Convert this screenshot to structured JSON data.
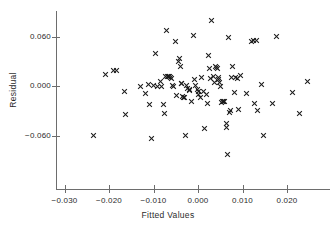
{
  "chart_data": {
    "type": "scatter",
    "title": "",
    "xlabel": "Fitted Values",
    "ylabel": "Residual",
    "xlim": [
      -0.0325,
      0.0295
    ],
    "ylim": [
      -0.093,
      0.093
    ],
    "grid": false,
    "legend": null,
    "marker": "x",
    "marker_color": "#1c1c1c",
    "xticks": [
      -0.03,
      -0.02,
      -0.01,
      0.0,
      0.01,
      0.02
    ],
    "xtick_labels": [
      "-0.030",
      "-0.020",
      "-0.010",
      "0.000",
      "0.010",
      "0.020"
    ],
    "yticks": [
      0.06,
      0.0,
      -0.06
    ],
    "ytick_labels": [
      "0.060",
      "0.000",
      "-0.060"
    ],
    "points": [
      {
        "x": -0.0234,
        "y": -0.0604
      },
      {
        "x": -0.0209,
        "y": 0.0143
      },
      {
        "x": -0.0189,
        "y": 0.0193
      },
      {
        "x": -0.0184,
        "y": 0.0193
      },
      {
        "x": -0.0166,
        "y": -0.0072
      },
      {
        "x": -0.0162,
        "y": -0.035
      },
      {
        "x": -0.013,
        "y": 0.0
      },
      {
        "x": -0.0117,
        "y": -0.009
      },
      {
        "x": -0.0112,
        "y": 0.0024
      },
      {
        "x": -0.0108,
        "y": -0.0219
      },
      {
        "x": -0.0105,
        "y": -0.064
      },
      {
        "x": -0.0101,
        "y": 0.0002
      },
      {
        "x": -0.0096,
        "y": 0.0399
      },
      {
        "x": -0.0091,
        "y": 0.0
      },
      {
        "x": -0.0085,
        "y": 0.006
      },
      {
        "x": -0.0081,
        "y": -0.0009
      },
      {
        "x": -0.0078,
        "y": -0.0219
      },
      {
        "x": -0.0076,
        "y": -0.0339
      },
      {
        "x": -0.0073,
        "y": 0.0112
      },
      {
        "x": -0.007,
        "y": 0.0672
      },
      {
        "x": -0.0068,
        "y": 0.0117
      },
      {
        "x": -0.0066,
        "y": 0.012
      },
      {
        "x": -0.0064,
        "y": 0.0118
      },
      {
        "x": -0.0062,
        "y": 0.0105
      },
      {
        "x": -0.006,
        "y": 0.0094
      },
      {
        "x": -0.0057,
        "y": 0.0003
      },
      {
        "x": -0.0054,
        "y": -0.0002
      },
      {
        "x": -0.005,
        "y": 0.0545
      },
      {
        "x": -0.0048,
        "y": -0.0116
      },
      {
        "x": -0.0044,
        "y": 0.0295
      },
      {
        "x": -0.0042,
        "y": 0.0334
      },
      {
        "x": -0.004,
        "y": 0.024
      },
      {
        "x": -0.0038,
        "y": 0.003
      },
      {
        "x": -0.0036,
        "y": 0.0032
      },
      {
        "x": -0.0034,
        "y": -0.0128
      },
      {
        "x": -0.0032,
        "y": -0.0134
      },
      {
        "x": -0.003,
        "y": -0.0145
      },
      {
        "x": -0.0028,
        "y": -0.0604
      },
      {
        "x": -0.0025,
        "y": 0.0002
      },
      {
        "x": -0.0023,
        "y": -0.003
      },
      {
        "x": -0.002,
        "y": -0.0047
      },
      {
        "x": -0.0018,
        "y": -0.0058
      },
      {
        "x": -0.0014,
        "y": -0.0189
      },
      {
        "x": -0.001,
        "y": 0.061
      },
      {
        "x": -0.0008,
        "y": 0.0082
      },
      {
        "x": -0.0005,
        "y": 0.0012
      },
      {
        "x": -0.0002,
        "y": -0.0048
      },
      {
        "x": 0.0,
        "y": -0.0061
      },
      {
        "x": 0.0002,
        "y": -0.0108
      },
      {
        "x": 0.0005,
        "y": -0.014
      },
      {
        "x": 0.0008,
        "y": 0.01
      },
      {
        "x": 0.0012,
        "y": -0.0068
      },
      {
        "x": 0.0015,
        "y": -0.0518
      },
      {
        "x": 0.0018,
        "y": -0.0098
      },
      {
        "x": 0.0021,
        "y": -0.021
      },
      {
        "x": 0.0024,
        "y": 0.0374
      },
      {
        "x": 0.0026,
        "y": 0.0214
      },
      {
        "x": 0.0029,
        "y": 0.0087
      },
      {
        "x": 0.0031,
        "y": 0.0796
      },
      {
        "x": 0.0034,
        "y": 0.011
      },
      {
        "x": 0.0036,
        "y": 0.0042
      },
      {
        "x": 0.0039,
        "y": 0.0236
      },
      {
        "x": 0.0041,
        "y": 0.0225
      },
      {
        "x": 0.0043,
        "y": 0.0212
      },
      {
        "x": 0.0045,
        "y": 0.01
      },
      {
        "x": 0.0047,
        "y": 0.0078
      },
      {
        "x": 0.0049,
        "y": 0.004
      },
      {
        "x": 0.0051,
        "y": -0.0007
      },
      {
        "x": 0.0053,
        "y": -0.02
      },
      {
        "x": 0.0056,
        "y": -0.0188
      },
      {
        "x": 0.0058,
        "y": -0.0186
      },
      {
        "x": 0.006,
        "y": -0.0184
      },
      {
        "x": 0.0063,
        "y": -0.0455
      },
      {
        "x": 0.0065,
        "y": -0.0497
      },
      {
        "x": 0.0066,
        "y": -0.0832
      },
      {
        "x": 0.0068,
        "y": 0.0585
      },
      {
        "x": 0.0071,
        "y": -0.032
      },
      {
        "x": 0.0073,
        "y": -0.03
      },
      {
        "x": 0.0076,
        "y": 0.0109
      },
      {
        "x": 0.0078,
        "y": 0.0234
      },
      {
        "x": 0.0081,
        "y": -0.0076
      },
      {
        "x": 0.0085,
        "y": 0.0104
      },
      {
        "x": 0.0088,
        "y": 0.0097
      },
      {
        "x": 0.0092,
        "y": -0.0289
      },
      {
        "x": 0.0096,
        "y": 0.0132
      },
      {
        "x": 0.0108,
        "y": -0.0088
      },
      {
        "x": 0.012,
        "y": 0.0538
      },
      {
        "x": 0.0124,
        "y": 0.0551
      },
      {
        "x": 0.0128,
        "y": -0.0218
      },
      {
        "x": 0.0131,
        "y": 0.0555
      },
      {
        "x": 0.0133,
        "y": -0.0296
      },
      {
        "x": 0.0143,
        "y": 0.002
      },
      {
        "x": 0.0147,
        "y": -0.0604
      },
      {
        "x": 0.0168,
        "y": -0.0208
      },
      {
        "x": 0.0176,
        "y": 0.06
      },
      {
        "x": 0.0213,
        "y": -0.0073
      },
      {
        "x": 0.0228,
        "y": -0.0328
      },
      {
        "x": 0.0247,
        "y": 0.0055
      }
    ]
  },
  "axis_style": {
    "line_color": "#6d6d6d",
    "tick_color": "#6d6d6d",
    "label_color": "#2b2b2b"
  }
}
